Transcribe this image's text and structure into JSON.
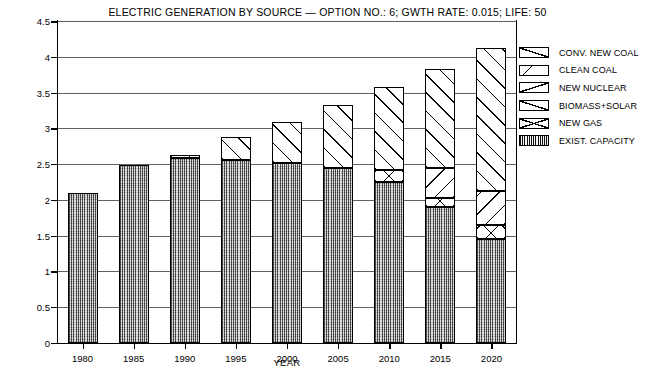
{
  "chart_data": {
    "type": "bar",
    "stacked": true,
    "title": "ELECTRIC GENERATION BY SOURCE — OPTION NO.: 6; GWTH RATE: 0.015; LIFE: 50",
    "xlabel": "YEAR",
    "ylabel": "ELECTRICITY GENERATED, 10¹² kwh",
    "ylabel_text": "ELECTRICITY GENERATED, 10",
    "ylabel_exp": "12",
    "ylabel_unit": " kwh",
    "grid": true,
    "legend_position": "right",
    "ylim": [
      0,
      4.5
    ],
    "ytick_step": 0.5,
    "yticks": [
      "0",
      "0.5",
      "1",
      "1.5",
      "2",
      "2.5",
      "3",
      "3.5",
      "4",
      "4.5"
    ],
    "categories": [
      "1980",
      "1985",
      "1990",
      "1995",
      "2000",
      "2005",
      "2010",
      "2015",
      "2020"
    ],
    "series": [
      {
        "name": "EXIST. CAPACITY",
        "pattern": "exist",
        "values": [
          2.1,
          2.48,
          2.58,
          2.55,
          2.52,
          2.45,
          2.25,
          1.9,
          1.45
        ]
      },
      {
        "name": "NEW GAS",
        "pattern": "gas",
        "values": [
          0,
          0,
          0,
          0,
          0,
          0,
          0.17,
          0.13,
          0.2
        ]
      },
      {
        "name": "BIOMASS+SOLAR",
        "pattern": "bio",
        "values": [
          0,
          0,
          0,
          0,
          0,
          0,
          0,
          0,
          0
        ]
      },
      {
        "name": "NEW NUCLEAR",
        "pattern": "nuke",
        "values": [
          0,
          0,
          0,
          0,
          0,
          0,
          0,
          0.42,
          0.47
        ]
      },
      {
        "name": "CLEAN COAL",
        "pattern": "clean",
        "values": [
          0,
          0,
          0,
          0,
          0,
          0,
          0,
          0,
          0
        ]
      },
      {
        "name": "CONV. NEW COAL",
        "pattern": "conv",
        "values": [
          0,
          0,
          0.05,
          0.33,
          0.57,
          0.88,
          1.16,
          1.38,
          2.0
        ]
      }
    ],
    "totals": [
      2.1,
      2.48,
      2.63,
      2.88,
      3.09,
      3.33,
      3.58,
      3.83,
      4.12
    ]
  },
  "legend": {
    "items": [
      {
        "label": "CONV. NEW COAL",
        "swatch": "conv"
      },
      {
        "label": "CLEAN COAL",
        "swatch": "clean"
      },
      {
        "label": "NEW NUCLEAR",
        "swatch": "nuke"
      },
      {
        "label": "BIOMASS+SOLAR",
        "swatch": "bio"
      },
      {
        "label": "NEW GAS",
        "swatch": "gas"
      },
      {
        "label": "EXIST. CAPACITY",
        "swatch": "exist"
      }
    ]
  },
  "colors": {
    "ink": "#000000",
    "paper": "#ffffff",
    "exist_fill": "#a7a7a7"
  }
}
